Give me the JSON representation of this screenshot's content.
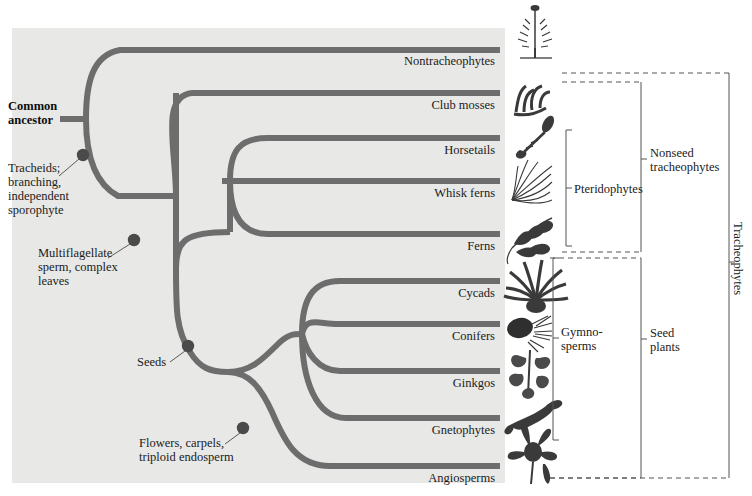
{
  "figure": {
    "type": "phylogenetic-tree",
    "panel_color": "#e8e8e6",
    "branch_color": "#6d6d6d",
    "node_color": "#4a4a4a",
    "text_color": "#1b1b1b"
  },
  "root": {
    "label_line1": "Common",
    "label_line2": "ancestor"
  },
  "tips": [
    {
      "name": "Nontracheophytes",
      "y": 47,
      "icon": "moss-plant-icon"
    },
    {
      "name": "Club mosses",
      "y": 91,
      "icon": "club-moss-icon"
    },
    {
      "name": "Horsetails",
      "y": 136,
      "icon": "horsetail-icon"
    },
    {
      "name": "Whisk ferns",
      "y": 181,
      "icon": "whisk-fern-icon"
    },
    {
      "name": "Ferns",
      "y": 235,
      "icon": "fern-frond-icon"
    },
    {
      "name": "Cycads",
      "y": 284,
      "icon": "cycad-icon"
    },
    {
      "name": "Conifers",
      "y": 326,
      "icon": "conifer-cone-icon"
    },
    {
      "name": "Ginkgos",
      "y": 375,
      "icon": "ginkgo-icon"
    },
    {
      "name": "Gnetophytes",
      "y": 421,
      "icon": "gnetophyte-icon"
    },
    {
      "name": "Angiosperms",
      "y": 469,
      "icon": "flower-icon"
    }
  ],
  "synapomorphies": [
    {
      "id": "tracheids",
      "lines": [
        "Tracheids;",
        "branching,",
        "independent",
        "sporophyte"
      ],
      "node_x": 83,
      "node_y": 155,
      "text_x": 8,
      "text_y": 161
    },
    {
      "id": "multiflagellate-sperm",
      "lines": [
        "Multiflagellate",
        "sperm, complex",
        "leaves"
      ],
      "node_x": 134,
      "node_y": 240,
      "text_x": 38,
      "text_y": 246
    },
    {
      "id": "seeds",
      "lines": [
        "Seeds"
      ],
      "node_x": 188,
      "node_y": 346,
      "text_x": 137,
      "text_y": 358
    },
    {
      "id": "flowers-carpels",
      "lines": [
        "Flowers, carpels,",
        "triploid endosperm"
      ],
      "node_x": 243,
      "node_y": 428,
      "text_x": 139,
      "text_y": 436
    }
  ],
  "brackets": [
    {
      "id": "pteridophytes",
      "label_lines": [
        "Pteridophytes"
      ],
      "style": "solid",
      "x": 566,
      "y_top": 130,
      "y_bottom": 246,
      "label_x": 574,
      "label_y": 182,
      "orientation": "horizontal"
    },
    {
      "id": "gymnosperms",
      "label_lines": [
        "Gymno-",
        "sperms"
      ],
      "style": "solid",
      "x": 553,
      "y_top": 258,
      "y_bottom": 440,
      "label_x": 561,
      "label_y": 338,
      "orientation": "horizontal"
    },
    {
      "id": "nonseed-tracheophytes",
      "label_lines": [
        "Nonseed",
        "tracheophytes"
      ],
      "style": "dashed",
      "x": 641,
      "y_top": 82,
      "y_bottom": 252,
      "label_x": 649,
      "label_y": 159,
      "orientation": "horizontal"
    },
    {
      "id": "seed-plants",
      "label_lines": [
        "Seed",
        "plants"
      ],
      "style": "dashed",
      "x": 641,
      "y_top": 258,
      "y_bottom": 478,
      "label_x": 649,
      "label_y": 339,
      "orientation": "horizontal"
    },
    {
      "id": "tracheophytes",
      "label_lines": [
        "Tracheophytes"
      ],
      "style": "dashed",
      "x": 729,
      "y_top": 73,
      "y_bottom": 478,
      "label_x": 739,
      "label_y": 222,
      "orientation": "vertical"
    }
  ]
}
